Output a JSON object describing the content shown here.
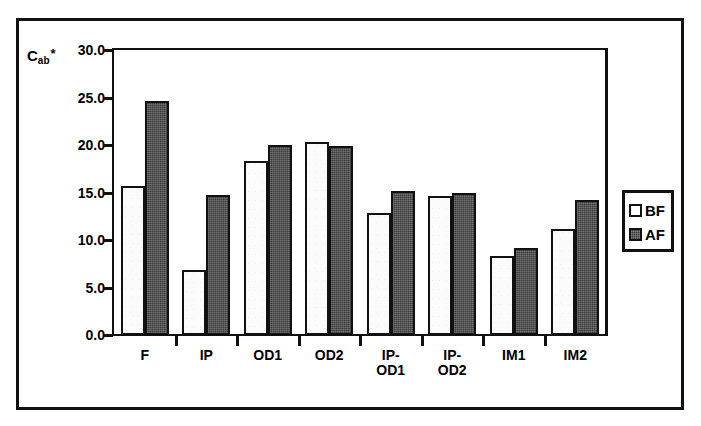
{
  "chart_data": {
    "type": "bar",
    "title": "",
    "subtitle": "",
    "xlabel": "",
    "ylabel": "C*ab",
    "ylabel_base": "C",
    "ylabel_sub": "ab",
    "ylabel_sup": "*",
    "categories": [
      "F",
      "IP",
      "OD1",
      "OD2",
      "IP-\nOD1",
      "IP-\nOD2",
      "IM1",
      "IM2"
    ],
    "category_plain": [
      "F",
      "IP",
      "OD1",
      "OD2",
      "IP-OD1",
      "IP-OD2",
      "IM1",
      "IM2"
    ],
    "series": [
      {
        "name": "BF",
        "fill": "#ffffff",
        "values": [
          15.7,
          6.8,
          18.3,
          20.3,
          12.8,
          14.6,
          8.3,
          11.2
        ]
      },
      {
        "name": "AF",
        "fill": "#3a3a3a",
        "values": [
          24.6,
          14.7,
          20.0,
          19.9,
          15.2,
          14.9,
          9.2,
          14.2
        ]
      }
    ],
    "ylim": [
      0.0,
      30.0
    ],
    "ytick_values": [
      30.0,
      25.0,
      20.0,
      15.0,
      10.0,
      5.0,
      0.0
    ],
    "ytick_labels": [
      "30.0",
      "25.0",
      "20.0",
      "15.0",
      "10.0",
      "5.0",
      "0.0"
    ],
    "grid": false,
    "legend_position": "right-outside",
    "legend_entries": [
      "BF",
      "AF"
    ]
  },
  "legend": {
    "items": [
      {
        "label": "BF",
        "swatch": "open-square-swatch"
      },
      {
        "label": "AF",
        "swatch": "filled-square-swatch"
      }
    ]
  },
  "colors": {
    "ink": "#111111",
    "paper": "#ffffff",
    "series_bf": "#ffffff",
    "series_af": "#3a3a3a"
  }
}
